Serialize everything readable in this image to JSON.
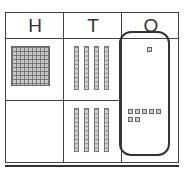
{
  "columns": [
    {
      "key": "H",
      "label": "H",
      "meaning": "Hundreds"
    },
    {
      "key": "T",
      "label": "T",
      "meaning": "Tens"
    },
    {
      "key": "O",
      "label": "O",
      "meaning": "Ones"
    }
  ],
  "rows": [
    {
      "hundreds_flats": 1,
      "tens_rods": 4,
      "ones_cubes": 1
    },
    {
      "hundreds_flats": 0,
      "tens_rods": 4,
      "ones_cubes": 7
    }
  ],
  "ones_grouped_in_frame": true,
  "represented_numbers": [
    141,
    47
  ]
}
